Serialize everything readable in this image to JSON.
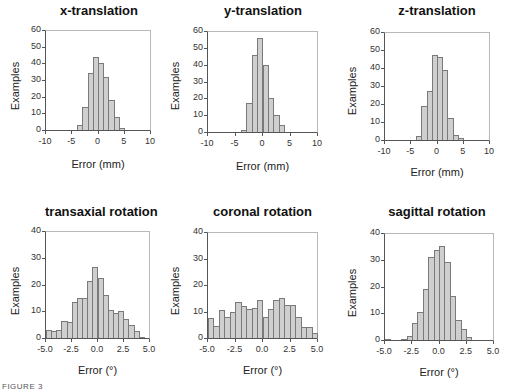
{
  "chart_data": [
    {
      "type": "bar",
      "title": "x-translation",
      "xlabel": "Error (mm)",
      "ylabel": "Examples",
      "xlim": [
        -10,
        10
      ],
      "ylim": [
        0,
        60
      ],
      "xticks": [
        "-10",
        "-5",
        "0",
        "5",
        "10"
      ],
      "yticks": [
        "0",
        "10",
        "20",
        "30",
        "40",
        "50",
        "60"
      ],
      "bin_width": 1,
      "bin_starts": [
        -4,
        -3,
        -2,
        -1,
        0,
        1,
        2,
        3,
        4
      ],
      "values": [
        3,
        14,
        34,
        44,
        40,
        32,
        18,
        8,
        1
      ],
      "grid": false
    },
    {
      "type": "bar",
      "title": "y-translation",
      "xlabel": "Error (mm)",
      "ylabel": "Examples",
      "xlim": [
        -10,
        10
      ],
      "ylim": [
        0,
        60
      ],
      "xticks": [
        "-10",
        "-5",
        "0",
        "5",
        "10"
      ],
      "yticks": [
        "0",
        "10",
        "20",
        "30",
        "40",
        "50",
        "60"
      ],
      "bin_width": 1,
      "bin_starts": [
        -4,
        -3,
        -2,
        -1,
        0,
        1,
        2,
        3
      ],
      "values": [
        1,
        17,
        46,
        56,
        40,
        20,
        10,
        4
      ],
      "grid": false
    },
    {
      "type": "bar",
      "title": "z-translation",
      "xlabel": "Error (mm)",
      "ylabel": "Examples",
      "xlim": [
        -10,
        10
      ],
      "ylim": [
        0,
        60
      ],
      "xticks": [
        "-10",
        "-5",
        "0",
        "5",
        "10"
      ],
      "yticks": [
        "0",
        "10",
        "20",
        "30",
        "40",
        "50",
        "60"
      ],
      "bin_width": 1,
      "bin_starts": [
        -4,
        -3,
        -2,
        -1,
        0,
        1,
        2,
        3,
        4
      ],
      "values": [
        2,
        19,
        27,
        47,
        46,
        39,
        12,
        3,
        1
      ],
      "grid": false
    },
    {
      "type": "bar",
      "title": "transaxial rotation",
      "xlabel": "Error (°)",
      "ylabel": "Examples",
      "xlim": [
        -5,
        5
      ],
      "ylim": [
        0,
        40
      ],
      "xticks": [
        "-5.0",
        "-2.5",
        "0.0",
        "2.5",
        "5.0"
      ],
      "yticks": [
        "0",
        "10",
        "20",
        "30",
        "40"
      ],
      "bin_width": 0.5,
      "bin_starts": [
        -5.0,
        -4.5,
        -4.0,
        -3.5,
        -3.0,
        -2.5,
        -2.0,
        -1.5,
        -1.0,
        -0.5,
        0.0,
        0.5,
        1.0,
        1.5,
        2.0,
        2.5,
        3.0,
        3.5,
        4.0,
        4.5
      ],
      "values": [
        3,
        2.5,
        3,
        6.5,
        6,
        13.5,
        15,
        15,
        21.5,
        26.5,
        22.5,
        16,
        10.5,
        9.5,
        10,
        7,
        5,
        2.5,
        0.5,
        0
      ],
      "grid": false
    },
    {
      "type": "bar",
      "title": "coronal rotation",
      "xlabel": "Error (°)",
      "ylabel": "Examples",
      "xlim": [
        -5,
        5
      ],
      "ylim": [
        0,
        40
      ],
      "xticks": [
        "-5.0",
        "-2.5",
        "0.0",
        "2.5",
        "5.0"
      ],
      "yticks": [
        "0",
        "10",
        "20",
        "30",
        "40"
      ],
      "bin_width": 0.5,
      "bin_starts": [
        -5.0,
        -4.5,
        -4.0,
        -3.5,
        -3.0,
        -2.5,
        -2.0,
        -1.5,
        -1.0,
        -0.5,
        0.0,
        0.5,
        1.0,
        1.5,
        2.0,
        2.5,
        3.0,
        3.5,
        4.0,
        4.5
      ],
      "values": [
        7.5,
        4.5,
        10.5,
        8,
        10,
        13.5,
        12,
        11,
        11.5,
        14.5,
        8,
        11,
        14.5,
        15,
        12.5,
        12.5,
        8,
        4,
        4,
        2
      ],
      "grid": false
    },
    {
      "type": "bar",
      "title": "sagittal rotation",
      "xlabel": "Error (°)",
      "ylabel": "Examples",
      "xlim": [
        -5,
        5
      ],
      "ylim": [
        0,
        40
      ],
      "xticks": [
        "-5.0",
        "-2.5",
        "0.0",
        "2.5",
        "5.0"
      ],
      "yticks": [
        "0",
        "10",
        "20",
        "30",
        "40"
      ],
      "bin_width": 0.5,
      "bin_starts": [
        -5.0,
        -4.5,
        -4.0,
        -3.5,
        -3.0,
        -2.5,
        -2.0,
        -1.5,
        -1.0,
        -0.5,
        0.0,
        0.5,
        1.0,
        1.5,
        2.0,
        2.5,
        3.0,
        3.5,
        4.0,
        4.5
      ],
      "values": [
        0.5,
        0,
        0,
        0.5,
        1.5,
        6.5,
        10.5,
        19,
        31,
        33.5,
        35,
        29,
        16.5,
        7.5,
        4,
        1,
        0,
        0,
        0,
        0
      ],
      "grid": false
    }
  ],
  "panels": [
    {
      "title": "x-translation",
      "xlabel": "Error (mm)",
      "ylabel": "Examples"
    },
    {
      "title": "y-translation",
      "xlabel": "Error (mm)",
      "ylabel": "Examples"
    },
    {
      "title": "z-translation",
      "xlabel": "Error (mm)",
      "ylabel": "Examples"
    },
    {
      "title": "transaxial rotation",
      "xlabel": "Error (°)",
      "ylabel": "Examples"
    },
    {
      "title": "coronal rotation",
      "xlabel": "Error (°)",
      "ylabel": "Examples"
    },
    {
      "title": "sagittal rotation",
      "xlabel": "Error (°)",
      "ylabel": "Examples"
    }
  ],
  "caption": "FIGURE 3"
}
